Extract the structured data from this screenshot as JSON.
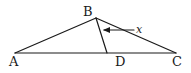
{
  "diagram": {
    "points": {
      "A": {
        "label": "A",
        "x": 15,
        "y": 53
      },
      "B": {
        "label": "B",
        "x": 96,
        "y": 18
      },
      "C": {
        "label": "C",
        "x": 176,
        "y": 53
      },
      "D": {
        "label": "D",
        "x": 107,
        "y": 53
      }
    },
    "segments": [
      {
        "name": "AB",
        "from": "A",
        "to": "B"
      },
      {
        "name": "BC",
        "from": "B",
        "to": "C"
      },
      {
        "name": "AC",
        "from": "A",
        "to": "C"
      },
      {
        "name": "BD",
        "from": "B",
        "to": "D"
      }
    ],
    "angle_annotation": {
      "label": "x",
      "description": "angle DBC indicated by arrow"
    },
    "colors": {
      "stroke": "#1a1a1a",
      "background": "#ffffff"
    }
  }
}
